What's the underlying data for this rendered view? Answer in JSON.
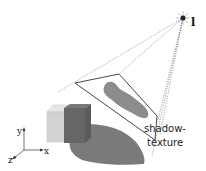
{
  "diagram": {
    "type": "shadow-texture-projection",
    "labels": {
      "light": "l",
      "shadow_texture_line1": "shadow-",
      "shadow_texture_line2": "texture",
      "axis_x": "x",
      "axis_y": "y",
      "axis_z": "z"
    },
    "colors": {
      "background": "#ffffff",
      "shadow_blob": "#7a7a7a",
      "texture_blob": "#8c8c8c",
      "cube_front": "#d4d4d4",
      "cube_top": "#e4e4e4",
      "occluder": "#6a6a6a",
      "lines": "#333333"
    },
    "elements": [
      {
        "id": "light-source",
        "label": "l"
      },
      {
        "id": "projection-frustum-lines"
      },
      {
        "id": "shadow-texture-plane",
        "label": "shadow-texture"
      },
      {
        "id": "occluder-box"
      },
      {
        "id": "receiver-cube"
      },
      {
        "id": "cast-shadow"
      },
      {
        "id": "coordinate-axes",
        "labels": [
          "x",
          "y",
          "z"
        ]
      }
    ]
  }
}
